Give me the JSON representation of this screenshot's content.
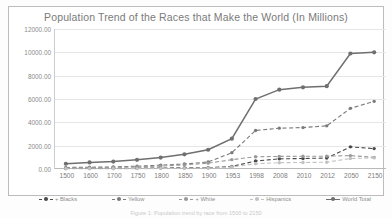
{
  "chart_data": {
    "type": "line",
    "title": "Population Trend of the Races that Make the World (In Millions)",
    "xlabel": "",
    "ylabel": "",
    "ylim": [
      0,
      12000
    ],
    "ytick_labels": [
      "0.00",
      "2000.00",
      "4000.00",
      "6000.00",
      "8000.00",
      "10000.00",
      "12000.00"
    ],
    "ytick_values": [
      0,
      2000,
      4000,
      6000,
      8000,
      10000,
      12000
    ],
    "grid": true,
    "legend_position": "bottom",
    "categories": [
      "1500",
      "1600",
      "1700",
      "1750",
      "1800",
      "1850",
      "1900",
      "1953",
      "1998",
      "2008",
      "2010",
      "2012",
      "2050",
      "2150"
    ],
    "series": [
      {
        "name": "+ Blacks",
        "color": "#4a4a4a",
        "style": "dashed",
        "marker": "circle",
        "values": [
          46,
          55,
          61,
          70,
          90,
          95,
          110,
          220,
          680,
          870,
          900,
          940,
          1900,
          1750
        ]
      },
      {
        "name": "Yellow",
        "color": "#7a7a7a",
        "style": "dashed",
        "marker": "circle",
        "values": [
          130,
          150,
          180,
          240,
          330,
          430,
          600,
          1400,
          3300,
          3500,
          3550,
          3700,
          5200,
          5800
        ]
      },
      {
        "name": "+ White",
        "color": "#9a9a9a",
        "style": "dashed",
        "marker": "circle",
        "values": [
          90,
          110,
          140,
          180,
          250,
          350,
          500,
          800,
          1050,
          1080,
          1090,
          1100,
          1150,
          1000
        ]
      },
      {
        "name": "Hispanics",
        "color": "#c2c2c2",
        "style": "dashed",
        "marker": "circle",
        "values": [
          20,
          22,
          25,
          30,
          40,
          55,
          80,
          170,
          450,
          540,
          560,
          580,
          900,
          950
        ]
      },
      {
        "name": "World Total",
        "color": "#6f6f6f",
        "style": "solid",
        "marker": "circle",
        "values": [
          450,
          560,
          640,
          790,
          980,
          1260,
          1650,
          2600,
          6000,
          6800,
          7000,
          7100,
          9900,
          10000
        ]
      }
    ]
  },
  "caption": {
    "text": "Figure 1: Population trend by race from 1500 to 2150"
  }
}
